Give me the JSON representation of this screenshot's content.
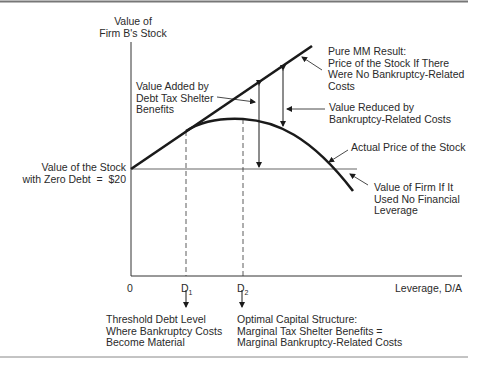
{
  "diagram": {
    "y_axis_label": "Value of\nFirm B's Stock",
    "x_axis_label": "Leverage, D/A",
    "origin_label": "0",
    "zero_debt_label": "Value of the Stock\nwith Zero Debt  =  $20",
    "d1_label": "D",
    "d1_sub": "1",
    "d2_label": "D",
    "d2_sub": "2",
    "annotations": {
      "pure_mm": "Pure MM Result:\nPrice of the Stock If There\nWere No Bankruptcy-Related\nCosts",
      "value_added": "Value Added by\nDebt Tax Shelter\nBenefits",
      "value_reduced": "Value Reduced by\nBankruptcy-Related Costs",
      "actual_price": "Actual Price of the Stock",
      "no_leverage": "Value of Firm If It\nUsed No Financial\nLeverage",
      "threshold": "Threshold Debt Level\nWhere Bankruptcy Costs\nBecome Material",
      "optimal": "Optimal Capital Structure:\nMarginal Tax Shelter Benefits =\nMarginal Bankruptcy-Related Costs"
    },
    "colors": {
      "line": "#1a1a1a",
      "baseline": "#999999",
      "rule": "#777777"
    }
  }
}
